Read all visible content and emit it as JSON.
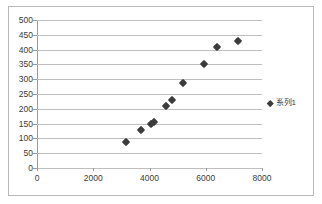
{
  "chart_data": {
    "type": "scatter",
    "title": "",
    "xlabel": "",
    "ylabel": "",
    "xlim": [
      0,
      8000
    ],
    "ylim": [
      0,
      500
    ],
    "xticks": [
      0,
      2000,
      4000,
      6000,
      8000
    ],
    "yticks": [
      0,
      50,
      100,
      150,
      200,
      250,
      300,
      350,
      400,
      450,
      500
    ],
    "grid": "horizontal",
    "legend_position": "right",
    "series": [
      {
        "name": "系列1",
        "marker": "diamond",
        "color": "#3b3b3b",
        "points": [
          [
            3150,
            88
          ],
          [
            3700,
            128
          ],
          [
            4050,
            148
          ],
          [
            4150,
            155
          ],
          [
            4600,
            208
          ],
          [
            4800,
            230
          ],
          [
            5200,
            288
          ],
          [
            5950,
            350
          ],
          [
            6400,
            408
          ],
          [
            7150,
            428
          ]
        ]
      }
    ]
  },
  "legend": {
    "entries": [
      {
        "label": "系列1",
        "marker": "diamond-icon",
        "color": "#3b3b3b"
      }
    ]
  },
  "axes": {
    "x_tick_labels": [
      "0",
      "2000",
      "4000",
      "6000",
      "8000"
    ],
    "y_tick_labels": [
      "0",
      "50",
      "100",
      "150",
      "200",
      "250",
      "300",
      "350",
      "400",
      "450",
      "500"
    ]
  },
  "colors": {
    "marker": "#3b3b3b",
    "gridline": "#bfbfbf",
    "axis": "#9a9a9a",
    "border": "#b8b8b8",
    "text": "#3a3a3a",
    "background": "#ffffff"
  }
}
